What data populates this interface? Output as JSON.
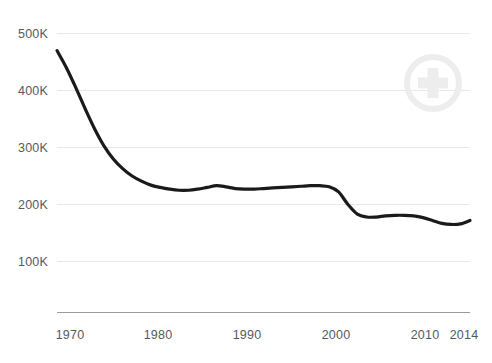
{
  "chart_data": {
    "type": "line",
    "title": "",
    "subtitle": "",
    "xlabel": "",
    "ylabel": "",
    "xlim": [
      1970,
      2014
    ],
    "ylim": [
      0,
      500000
    ],
    "grid": true,
    "legend": "none",
    "y_ticks": [
      {
        "value": 100000,
        "label": "100K"
      },
      {
        "value": 200000,
        "label": "200K"
      },
      {
        "value": 300000,
        "label": "300K"
      },
      {
        "value": 400000,
        "label": "400K"
      },
      {
        "value": 500000,
        "label": "500K"
      }
    ],
    "x_ticks": [
      {
        "value": 1970,
        "label": "1970"
      },
      {
        "value": 1980,
        "label": "1980"
      },
      {
        "value": 1990,
        "label": "1990"
      },
      {
        "value": 2000,
        "label": "2000"
      },
      {
        "value": 2010,
        "label": "2010"
      },
      {
        "value": 2014,
        "label": "2014"
      }
    ],
    "series": [
      {
        "name": "series-1",
        "color": "#1a1a1a",
        "line_width": 3.2,
        "x": [
          1970,
          1971,
          1972,
          1973,
          1974,
          1975,
          1976,
          1977,
          1978,
          1979,
          1980,
          1981,
          1982,
          1983,
          1984,
          1985,
          1986,
          1987,
          1988,
          1989,
          1990,
          1991,
          1992,
          1993,
          1994,
          1995,
          1996,
          1997,
          1998,
          1999,
          2000,
          2001,
          2002,
          2003,
          2004,
          2005,
          2006,
          2007,
          2008,
          2009,
          2010,
          2011,
          2012,
          2013,
          2014
        ],
        "y": [
          470000,
          440000,
          405000,
          368000,
          333000,
          303000,
          280000,
          263000,
          250000,
          241000,
          234000,
          230000,
          227000,
          225000,
          225000,
          227000,
          230000,
          233000,
          231000,
          228000,
          227000,
          227000,
          228000,
          229000,
          230000,
          231000,
          232000,
          233000,
          233000,
          231000,
          222000,
          200000,
          183000,
          178000,
          178000,
          180000,
          181000,
          181000,
          180000,
          177000,
          172000,
          167000,
          165000,
          166000,
          172000
        ]
      }
    ]
  },
  "axes": {
    "y_axis_name": "y-axis",
    "x_axis_name": "x-axis"
  },
  "watermark": {
    "icon": "medical-cross-circle-icon",
    "color": "#ededed"
  }
}
